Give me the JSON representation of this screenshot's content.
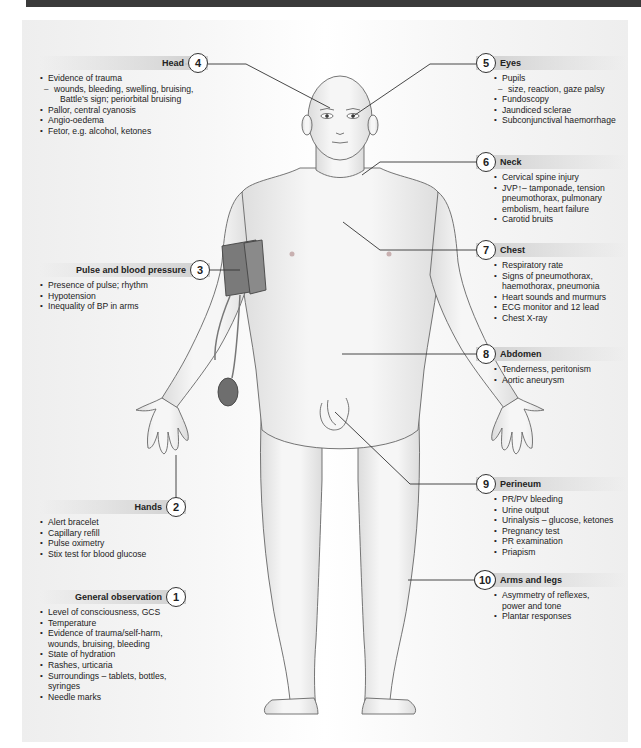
{
  "figure": {
    "colors": {
      "header_bar": "#3a3a3a",
      "panel_bg": "#f2f2f2",
      "label_band": "#cfcfcf",
      "skin": "#f0f0f0",
      "outline": "#555555",
      "cuff": "#7a7a7a"
    }
  },
  "sections": {
    "s1": {
      "number": "1",
      "title": "General observation",
      "items": [
        {
          "type": "bullet",
          "text": "Level of consciousness, GCS"
        },
        {
          "type": "bullet",
          "text": "Temperature"
        },
        {
          "type": "bullet",
          "text": "Evidence of trauma/self-harm,"
        },
        {
          "type": "cont",
          "text": "wounds, bruising, bleeding"
        },
        {
          "type": "bullet",
          "text": "State of hydration"
        },
        {
          "type": "bullet",
          "text": "Rashes, urticaria"
        },
        {
          "type": "bullet",
          "text": "Surroundings – tablets, bottles,"
        },
        {
          "type": "cont",
          "text": "syringes"
        },
        {
          "type": "bullet",
          "text": "Needle marks"
        }
      ]
    },
    "s2": {
      "number": "2",
      "title": "Hands",
      "items": [
        {
          "type": "bullet",
          "text": "Alert bracelet"
        },
        {
          "type": "bullet",
          "text": "Capillary refill"
        },
        {
          "type": "bullet",
          "text": "Pulse oximetry"
        },
        {
          "type": "bullet",
          "text": "Stix test for blood glucose"
        }
      ]
    },
    "s3": {
      "number": "3",
      "title": "Pulse and blood pressure",
      "items": [
        {
          "type": "bullet",
          "text": "Presence of pulse; rhythm"
        },
        {
          "type": "bullet",
          "text": "Hypotension"
        },
        {
          "type": "bullet",
          "text": "Inequality of BP in arms"
        }
      ]
    },
    "s4": {
      "number": "4",
      "title": "Head",
      "items": [
        {
          "type": "bullet",
          "text": "Evidence of trauma"
        },
        {
          "type": "sub",
          "text": "wounds, bleeding, swelling, bruising,"
        },
        {
          "type": "subcont",
          "text": "Battle’s sign; periorbital bruising"
        },
        {
          "type": "bullet",
          "text": "Pallor, central cyanosis"
        },
        {
          "type": "bullet",
          "text": "Angio-oedema"
        },
        {
          "type": "bullet",
          "text": "Fetor, e.g. alcohol, ketones"
        }
      ]
    },
    "s5": {
      "number": "5",
      "title": "Eyes",
      "items": [
        {
          "type": "bullet",
          "text": "Pupils"
        },
        {
          "type": "sub",
          "text": "size, reaction, gaze palsy"
        },
        {
          "type": "bullet",
          "text": "Fundoscopy"
        },
        {
          "type": "bullet",
          "text": "Jaundiced sclerae"
        },
        {
          "type": "bullet",
          "text": "Subconjunctival haemorrhage"
        }
      ]
    },
    "s6": {
      "number": "6",
      "title": "Neck",
      "items": [
        {
          "type": "bullet",
          "text": "Cervical spine injury"
        },
        {
          "type": "bullet",
          "text": "JVP↑– tamponade, tension"
        },
        {
          "type": "cont",
          "text": "pneumothorax, pulmonary"
        },
        {
          "type": "cont",
          "text": "embolism, heart failure"
        },
        {
          "type": "bullet",
          "text": "Carotid bruits"
        }
      ]
    },
    "s7": {
      "number": "7",
      "title": "Chest",
      "items": [
        {
          "type": "bullet",
          "text": "Respiratory rate"
        },
        {
          "type": "bullet",
          "text": "Signs of pneumothorax,"
        },
        {
          "type": "cont",
          "text": "haemothorax, pneumonia"
        },
        {
          "type": "bullet",
          "text": "Heart sounds and murmurs"
        },
        {
          "type": "bullet",
          "text": "ECG monitor and 12 lead"
        },
        {
          "type": "bullet",
          "text": "Chest X-ray"
        }
      ]
    },
    "s8": {
      "number": "8",
      "title": "Abdomen",
      "items": [
        {
          "type": "bullet",
          "text": "Tenderness, peritonism"
        },
        {
          "type": "bullet",
          "text": "Aortic aneurysm"
        }
      ]
    },
    "s9": {
      "number": "9",
      "title": "Perineum",
      "items": [
        {
          "type": "bullet",
          "text": "PR/PV bleeding"
        },
        {
          "type": "bullet",
          "text": "Urine output"
        },
        {
          "type": "bullet",
          "text": "Urinalysis – glucose, ketones"
        },
        {
          "type": "bullet",
          "text": "Pregnancy test"
        },
        {
          "type": "bullet",
          "text": "PR examination"
        },
        {
          "type": "bullet",
          "text": "Priapism"
        }
      ]
    },
    "s10": {
      "number": "10",
      "title": "Arms and legs",
      "items": [
        {
          "type": "bullet",
          "text": "Asymmetry of reflexes,"
        },
        {
          "type": "cont",
          "text": "power and tone"
        },
        {
          "type": "bullet",
          "text": "Plantar responses"
        }
      ]
    }
  }
}
